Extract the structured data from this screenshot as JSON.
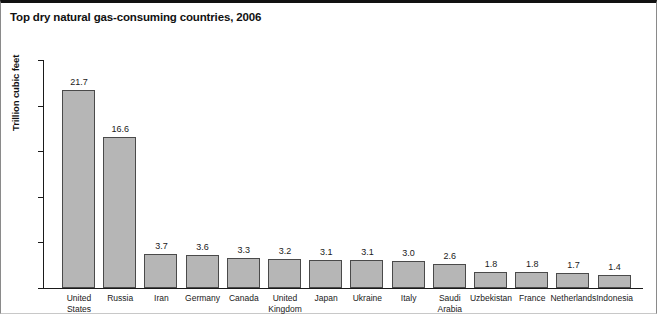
{
  "title": "Top dry natural gas-consuming countries, 2006",
  "axis": {
    "y_title": "Trillion cubic feet",
    "y_ticks": [
      "0",
      "5",
      "10",
      "15",
      "20",
      "25"
    ]
  },
  "chart_data": {
    "type": "bar",
    "title": "Top dry natural gas-consuming countries, 2006",
    "xlabel": "",
    "ylabel": "Trillion cubic feet",
    "ylim": [
      0,
      25
    ],
    "yticks": [
      0,
      5,
      10,
      15,
      20,
      25
    ],
    "grid": false,
    "legend": null,
    "bar_color": "#b6b6b6",
    "bar_edge_color": "#4a4a4a",
    "categories": [
      "United States",
      "Russia",
      "Iran",
      "Germany",
      "Canada",
      "United Kingdom",
      "Japan",
      "Ukraine",
      "Italy",
      "Saudi Arabia",
      "Uzbekistan",
      "France",
      "Netherlands",
      "Indonesia"
    ],
    "category_lines": [
      [
        "United",
        "States"
      ],
      [
        "Russia",
        ""
      ],
      [
        "Iran",
        ""
      ],
      [
        "Germany",
        ""
      ],
      [
        "Canada",
        ""
      ],
      [
        "United",
        "Kingdom"
      ],
      [
        "Japan",
        ""
      ],
      [
        "Ukraine",
        ""
      ],
      [
        "Italy",
        ""
      ],
      [
        "Saudi",
        "Arabia"
      ],
      [
        "Uzbekistan",
        ""
      ],
      [
        "France",
        ""
      ],
      [
        "Netherlands",
        ""
      ],
      [
        "Indonesia",
        ""
      ]
    ],
    "values": [
      21.7,
      16.6,
      3.7,
      3.6,
      3.3,
      3.2,
      3.1,
      3.1,
      3.0,
      2.6,
      1.8,
      1.8,
      1.7,
      1.4
    ],
    "value_labels": [
      "21.7",
      "16.6",
      "3.7",
      "3.6",
      "3.3",
      "3.2",
      "3.1",
      "3.1",
      "3.0",
      "2.6",
      "1.8",
      "1.8",
      "1.7",
      "1.4"
    ]
  }
}
